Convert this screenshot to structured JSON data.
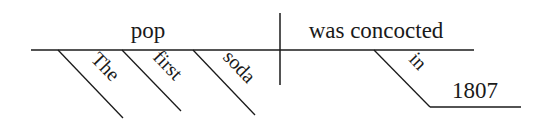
{
  "diagram": {
    "type": "sentence-diagram",
    "sentence": "The first soda pop was concocted in 1807",
    "subject": {
      "text": "pop"
    },
    "predicate": {
      "text": "was concocted"
    },
    "subject_modifiers": [
      {
        "text": "The"
      },
      {
        "text": "first"
      },
      {
        "text": "soda"
      }
    ],
    "predicate_modifiers": [
      {
        "preposition": "in",
        "object": "1807"
      }
    ],
    "colors": {
      "line": "#1a1a1a",
      "text": "#1a1a1a",
      "background": "#ffffff"
    }
  }
}
